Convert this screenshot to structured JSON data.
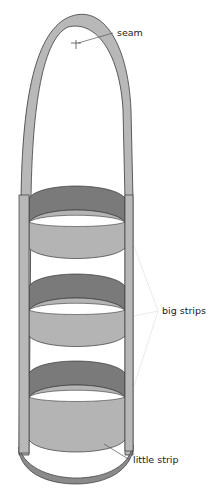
{
  "diagram": {
    "labels": {
      "seam": "seam",
      "big_strips": "big strips",
      "little_strip": "little strip"
    },
    "colors": {
      "strip_outer": "#b4b4b4",
      "strip_inner": "#7a7a7a",
      "outline": "#3a3a3a",
      "leader_line": "#555555",
      "faint_leader": "#e2e2e2",
      "background": "#ffffff"
    },
    "parts": [
      {
        "name": "handle",
        "count": 1
      },
      {
        "name": "big strip",
        "count": 3
      },
      {
        "name": "little strip",
        "count": 1
      }
    ]
  }
}
